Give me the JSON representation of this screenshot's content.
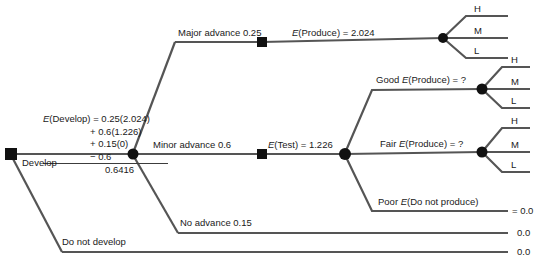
{
  "diagram": {
    "line_color": "#555555",
    "node_color": "#111111",
    "text_color": "#1a1a1a"
  },
  "calculation": {
    "line1_label": "E",
    "line1_rest": "(Develop) = 0.25(2.024)",
    "line2": "+ 0.6(1.226)",
    "line3": "+ 0.15(0)",
    "line4": "− 0.6",
    "line5": "0.6416"
  },
  "branches": {
    "develop": "Develop",
    "do_not_develop": "Do not develop",
    "major_advance": "Major advance 0.25",
    "minor_advance": "Minor advance 0.6",
    "no_advance": "No advance 0.15"
  },
  "nodes": {
    "e_produce_top_label": "E",
    "e_produce_top_rest": "(Produce) = 2.024",
    "e_test_label": "E",
    "e_test_rest": "(Test) = 1.226",
    "good_prefix": "Good ",
    "good_label": "E",
    "good_rest": "(Produce) = ?",
    "fair_prefix": "Fair ",
    "fair_label": "E",
    "fair_rest": "(Produce) = ?",
    "poor_prefix": "Poor ",
    "poor_label": "E",
    "poor_rest": "(Do not produce)"
  },
  "outcomes": {
    "top": [
      "H",
      "M",
      "L"
    ],
    "good": [
      "H",
      "M",
      "L"
    ],
    "fair": [
      "H",
      "M",
      "L"
    ]
  },
  "terminals": {
    "poor_value": "= 0.0",
    "no_advance_value": "0.0",
    "do_not_develop_value": "0.0"
  }
}
